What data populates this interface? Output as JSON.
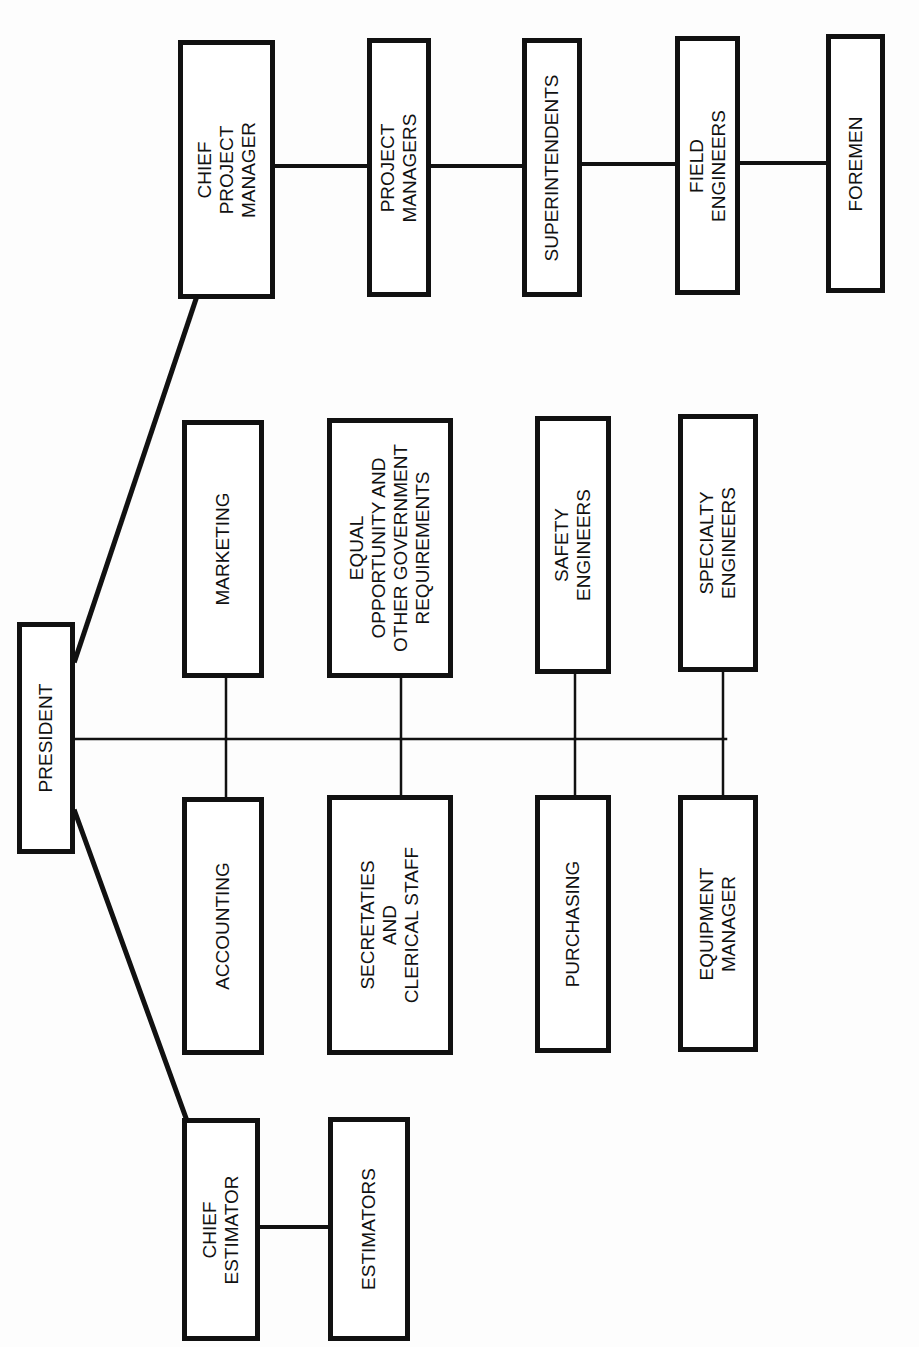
{
  "diagram": {
    "type": "org-chart",
    "orientation": "rotated-90-ccw",
    "colors": {
      "line": "#111111",
      "box_fill": "#ffffff",
      "background": "#fdfdfd"
    },
    "nodes": [
      {
        "id": "president",
        "lines": [
          "PRESIDENT"
        ],
        "box": [
          17,
          622,
          58,
          232
        ]
      },
      {
        "id": "chief_project_manager",
        "lines": [
          "CHIEF",
          "PROJECT",
          "MANAGER"
        ],
        "box": [
          178,
          40,
          97,
          259
        ]
      },
      {
        "id": "project_managers",
        "lines": [
          "PROJECT",
          "MANAGERS"
        ],
        "box": [
          367,
          38,
          64,
          259
        ]
      },
      {
        "id": "superintendents",
        "lines": [
          "SUPERINTENDENTS"
        ],
        "box": [
          522,
          38,
          60,
          259
        ]
      },
      {
        "id": "field_engineers",
        "lines": [
          "FIELD",
          "ENGINEERS"
        ],
        "box": [
          675,
          36,
          65,
          259
        ]
      },
      {
        "id": "foremen",
        "lines": [
          "FOREMEN"
        ],
        "box": [
          826,
          34,
          59,
          259
        ]
      },
      {
        "id": "marketing",
        "lines": [
          "MARKETING"
        ],
        "box": [
          182,
          420,
          82,
          258
        ]
      },
      {
        "id": "equal_opportunity",
        "lines": [
          "EQUAL",
          "OPPORTUNITY AND",
          "OTHER GOVERNMENT",
          "REQUIREMENTS"
        ],
        "box": [
          327,
          418,
          126,
          260
        ]
      },
      {
        "id": "safety_engineers",
        "lines": [
          "SAFETY",
          "ENGINEERS"
        ],
        "box": [
          535,
          416,
          76,
          258
        ]
      },
      {
        "id": "specialty_engineers",
        "lines": [
          "SPECIALTY",
          "ENGINEERS"
        ],
        "box": [
          678,
          414,
          80,
          258
        ]
      },
      {
        "id": "accounting",
        "lines": [
          "ACCOUNTING"
        ],
        "box": [
          182,
          797,
          82,
          258
        ]
      },
      {
        "id": "secretaries_clerical",
        "lines": [
          "SECRETATIES",
          "AND",
          "CLERICAL STAFF"
        ],
        "box": [
          327,
          795,
          126,
          260
        ]
      },
      {
        "id": "purchasing",
        "lines": [
          "PURCHASING"
        ],
        "box": [
          535,
          795,
          76,
          258
        ]
      },
      {
        "id": "equipment_manager",
        "lines": [
          "EQUIPMENT",
          "MANAGER"
        ],
        "box": [
          678,
          795,
          80,
          257
        ]
      },
      {
        "id": "chief_estimator",
        "lines": [
          "CHIEF",
          "ESTIMATOR"
        ],
        "box": [
          182,
          1118,
          78,
          223
        ]
      },
      {
        "id": "estimators",
        "lines": [
          "ESTIMATORS"
        ],
        "box": [
          328,
          1117,
          82,
          224
        ]
      }
    ],
    "edges": [
      {
        "from": "president",
        "to": "chief_project_manager",
        "points": [
          [
            75,
            660
          ],
          [
            196,
            299
          ]
        ],
        "width": 5
      },
      {
        "from": "president",
        "to": "chief_estimator",
        "points": [
          [
            75,
            812
          ],
          [
            186,
            1118
          ]
        ],
        "width": 5
      },
      {
        "from": "president",
        "to": "spine",
        "points": [
          [
            75,
            739
          ],
          [
            726,
            739
          ]
        ],
        "width": 2.5
      },
      {
        "from": "spine",
        "to": "marketing",
        "points": [
          [
            226,
            678
          ],
          [
            226,
            739
          ]
        ],
        "width": 2.5
      },
      {
        "from": "spine",
        "to": "accounting",
        "points": [
          [
            226,
            739
          ],
          [
            226,
            797
          ]
        ],
        "width": 2.5
      },
      {
        "from": "spine",
        "to": "equal_opportunity",
        "points": [
          [
            401,
            678
          ],
          [
            401,
            739
          ]
        ],
        "width": 2.5
      },
      {
        "from": "spine",
        "to": "secretaries_clerical",
        "points": [
          [
            401,
            739
          ],
          [
            401,
            795
          ]
        ],
        "width": 2.5
      },
      {
        "from": "spine",
        "to": "safety_engineers",
        "points": [
          [
            575,
            674
          ],
          [
            575,
            739
          ]
        ],
        "width": 2.5
      },
      {
        "from": "spine",
        "to": "purchasing",
        "points": [
          [
            575,
            739
          ],
          [
            575,
            795
          ]
        ],
        "width": 2.5
      },
      {
        "from": "spine",
        "to": "specialty_engineers",
        "points": [
          [
            723,
            672
          ],
          [
            723,
            739
          ]
        ],
        "width": 2.5
      },
      {
        "from": "spine",
        "to": "equipment_manager",
        "points": [
          [
            723,
            739
          ],
          [
            723,
            795
          ]
        ],
        "width": 2.5
      },
      {
        "from": "chief_project_manager",
        "to": "project_managers",
        "points": [
          [
            275,
            166
          ],
          [
            367,
            166
          ]
        ],
        "width": 4
      },
      {
        "from": "project_managers",
        "to": "superintendents",
        "points": [
          [
            431,
            166
          ],
          [
            522,
            166
          ]
        ],
        "width": 4
      },
      {
        "from": "superintendents",
        "to": "field_engineers",
        "points": [
          [
            582,
            164
          ],
          [
            675,
            164
          ]
        ],
        "width": 4
      },
      {
        "from": "field_engineers",
        "to": "foremen",
        "points": [
          [
            740,
            163
          ],
          [
            826,
            163
          ]
        ],
        "width": 4
      },
      {
        "from": "chief_estimator",
        "to": "estimators",
        "points": [
          [
            260,
            1227
          ],
          [
            328,
            1227
          ]
        ],
        "width": 4
      }
    ]
  }
}
